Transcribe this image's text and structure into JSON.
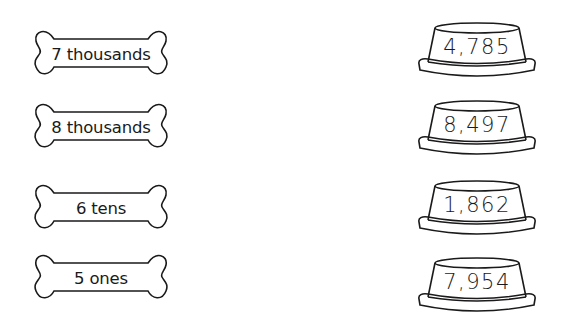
{
  "worksheet": {
    "bones": [
      {
        "label": "7 thousands"
      },
      {
        "label": "8 thousands"
      },
      {
        "label": "6 tens"
      },
      {
        "label": "5 ones"
      }
    ],
    "bowls": [
      {
        "number": "4,785"
      },
      {
        "number": "8,497"
      },
      {
        "number": "1,862"
      },
      {
        "number": "7,954"
      }
    ]
  },
  "colors": {
    "outline": "#1a1a1a",
    "background": "#ffffff"
  }
}
